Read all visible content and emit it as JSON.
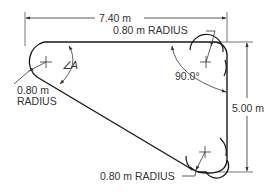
{
  "diagram": {
    "dimensions": {
      "width_label": "7.40 m",
      "height_label": "5.00 m"
    },
    "corners": {
      "top_left_radius_value": "0.80 m",
      "top_left_radius_word": "RADIUS",
      "top_right_radius_label": "0.80 m RADIUS",
      "bottom_right_radius_label": "0.80 m RADIUS"
    },
    "angles": {
      "angle_a_symbol": "∠",
      "angle_a_letter": "A",
      "right_angle_label": "90.0°"
    },
    "colors": {
      "line": "#1a1a1a",
      "dimension": "#333333",
      "background": "#ffffff"
    }
  }
}
